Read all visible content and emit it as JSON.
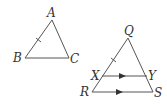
{
  "diagram": {
    "triangle_abc": {
      "vertices": {
        "A": {
          "label": "A",
          "x": 52,
          "y": 20
        },
        "B": {
          "label": "B",
          "x": 25,
          "y": 58
        },
        "C": {
          "label": "C",
          "x": 69,
          "y": 58
        }
      },
      "tick_marks": [
        "AB"
      ]
    },
    "triangle_qrs": {
      "vertices": {
        "Q": {
          "label": "Q",
          "x": 128,
          "y": 38
        },
        "R": {
          "label": "R",
          "x": 92,
          "y": 92
        },
        "S": {
          "label": "S",
          "x": 153,
          "y": 92
        },
        "X": {
          "label": "X",
          "x": 102,
          "y": 76
        },
        "Y": {
          "label": "Y",
          "x": 147,
          "y": 76
        }
      },
      "tick_marks": [
        "QX"
      ],
      "parallel_arrows": [
        "XY",
        "RS"
      ]
    },
    "colors": {
      "stroke": "#555555",
      "text": "#333333",
      "background": "#ffffff"
    }
  }
}
